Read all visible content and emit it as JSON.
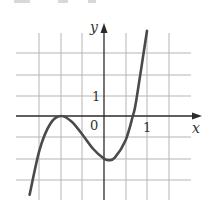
{
  "chart_data": {
    "type": "line",
    "title": "",
    "xlabel": "x",
    "ylabel": "y",
    "origin_label": "0",
    "x_tick_labels": [
      {
        "value": 1,
        "label": "1"
      }
    ],
    "y_tick_labels": [
      {
        "value": 1,
        "label": "1"
      }
    ],
    "grid": true,
    "grid_x_step": 0.5,
    "grid_y_step": 1,
    "xlim": [
      -2.0,
      2.0
    ],
    "ylim": [
      -4,
      4
    ],
    "series": [
      {
        "name": "f(x)",
        "description": "cubic with local max at (-1, 0), local min near (0.1, -2), x-intercept near 0.67",
        "x": [
          -1.73,
          -1.5,
          -1.25,
          -1.0,
          -0.75,
          -0.5,
          -0.25,
          0.0,
          0.11,
          0.25,
          0.5,
          0.67,
          0.75,
          1.0
        ],
        "y": [
          -3.7,
          -1.6,
          -0.36,
          0.0,
          -0.27,
          -0.88,
          -1.55,
          -2.0,
          -2.07,
          -1.96,
          -1.15,
          0.0,
          0.74,
          4.0
        ]
      }
    ],
    "key_points": {
      "local_max": [
        -1,
        0
      ],
      "local_min": [
        0.11,
        -2.07
      ],
      "x_intercepts": [
        -1,
        0.67
      ],
      "y_intercept": -2
    }
  },
  "labels": {
    "x_axis": "x",
    "y_axis": "y",
    "origin": "0",
    "x_one": "1",
    "y_one": "1"
  },
  "colors": {
    "grid": "#b5b5b5",
    "axis": "#2a2a2a",
    "curve": "#4a4a4a"
  }
}
